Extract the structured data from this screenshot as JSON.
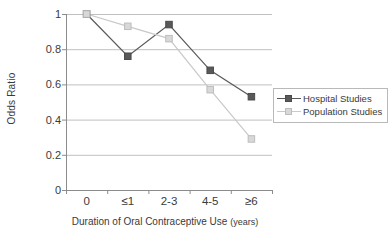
{
  "chart_data": {
    "type": "line",
    "title": "",
    "xlabel": "Duration of Oral Contraceptive Use (years)",
    "ylabel": "Odds Ratio",
    "categories": [
      "0",
      "≤1",
      "2-3",
      "4-5",
      "≥6"
    ],
    "ylim": [
      0,
      1
    ],
    "yticks": [
      "0",
      "0.2",
      "0.4",
      "0.6",
      "0.8",
      "1"
    ],
    "ytick_values": [
      0,
      0.2,
      0.4,
      0.6,
      0.8,
      1
    ],
    "grid": "horizontal",
    "legend_position": "right",
    "series": [
      {
        "name": "Hospital Studies",
        "color": "#595959",
        "marker": "filled-square",
        "values": [
          1.0,
          0.76,
          0.94,
          0.68,
          0.53
        ]
      },
      {
        "name": "Population Studies",
        "color": "#c9c9c9",
        "marker": "light-square",
        "values": [
          1.0,
          0.93,
          0.86,
          0.57,
          0.29
        ]
      }
    ]
  },
  "axis": {
    "y_title": "Odds Ratio",
    "x_title_main": "Duration of Oral Contraceptive Use",
    "x_title_unit": "(years)"
  },
  "legend": {
    "entries": [
      {
        "label": "Hospital Studies"
      },
      {
        "label": "Population Studies"
      }
    ]
  },
  "colors": {
    "hospital": "#595959",
    "population": "#c9c9c9",
    "axis": "#8c8c8c",
    "grid": "#c0c0c0",
    "text": "#3a3a3a"
  }
}
